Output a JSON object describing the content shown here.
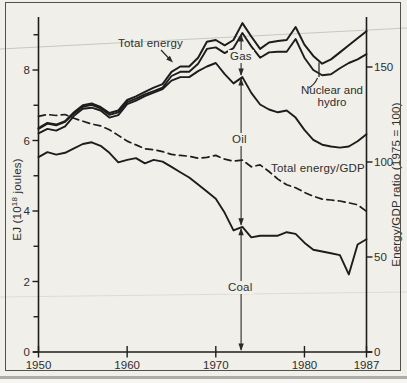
{
  "figure": {
    "paper_color": "#f1efe9",
    "frame_color": "#53514d",
    "line_color": "#1d1d1d",
    "artifact_line_color": "#c9c7c1"
  },
  "left_axis": {
    "title_pre": "EJ (10",
    "title_sup": "18",
    "title_post": " joules)",
    "major_tick_values": [
      0,
      2,
      4,
      6,
      8
    ],
    "major_tick_labels": [
      "0",
      "2",
      "4",
      "6",
      "8"
    ],
    "minor_tick_values": [
      1,
      3,
      5,
      7,
      9
    ]
  },
  "right_axis": {
    "title": "Energy/GDP ratio (1975 = 100)",
    "tick_values": [
      0,
      50,
      100,
      150
    ],
    "tick_labels": [
      "0",
      "50",
      "100",
      "150"
    ]
  },
  "x_axis": {
    "tick_values": [
      1950,
      1960,
      1970,
      1980,
      1987
    ],
    "tick_labels": [
      "1950",
      "1960",
      "1970",
      "1980",
      "1987"
    ]
  },
  "annotations": {
    "total_energy": "Total energy",
    "gas": "Gas",
    "oil": "Oil",
    "coal": "Coal",
    "nuclear_line1": "Nuclear and",
    "nuclear_line2": "hydro",
    "gdp": "Total energy/GDP",
    "marker_year": 1973
  },
  "chart_data": {
    "type": "line",
    "title": "",
    "xlabel": "",
    "ylabel_left": "EJ (10^18 joules)",
    "ylabel_right": "Energy/GDP ratio (1975 = 100)",
    "xlim": [
      1950,
      1987
    ],
    "ylim_left": [
      0,
      9.5
    ],
    "ylim_right": [
      0,
      160
    ],
    "grid": false,
    "legend_position": "inline-annotations",
    "x": [
      1950,
      1951,
      1952,
      1953,
      1954,
      1955,
      1956,
      1957,
      1958,
      1959,
      1960,
      1961,
      1962,
      1963,
      1964,
      1965,
      1966,
      1967,
      1968,
      1969,
      1970,
      1971,
      1972,
      1973,
      1974,
      1975,
      1976,
      1977,
      1978,
      1979,
      1980,
      1981,
      1982,
      1983,
      1984,
      1985,
      1986,
      1987
    ],
    "series": [
      {
        "id": "coal",
        "name": "Coal",
        "axis": "left",
        "style": "solid",
        "values": [
          5.53,
          5.67,
          5.6,
          5.65,
          5.78,
          5.9,
          5.95,
          5.85,
          5.65,
          5.38,
          5.45,
          5.5,
          5.35,
          5.45,
          5.4,
          5.25,
          5.1,
          4.95,
          4.75,
          4.55,
          4.35,
          3.95,
          3.45,
          3.55,
          3.25,
          3.3,
          3.3,
          3.3,
          3.4,
          3.35,
          3.1,
          2.9,
          2.85,
          2.8,
          2.75,
          2.2,
          3.05,
          3.2
        ]
      },
      {
        "id": "oil",
        "name": "Coal + Oil (top of Oil band)",
        "axis": "left",
        "style": "solid",
        "values": [
          6.2,
          6.33,
          6.28,
          6.4,
          6.7,
          6.9,
          6.93,
          6.85,
          6.65,
          6.72,
          7.03,
          7.13,
          7.26,
          7.36,
          7.46,
          7.7,
          7.8,
          7.8,
          7.97,
          8.1,
          8.2,
          7.88,
          7.62,
          7.8,
          7.35,
          7.02,
          6.88,
          6.8,
          6.85,
          6.65,
          6.3,
          6.02,
          5.88,
          5.83,
          5.8,
          5.83,
          5.98,
          6.18
        ]
      },
      {
        "id": "gas",
        "name": "Coal + Oil + Gas (top of Gas band)",
        "axis": "left",
        "style": "solid",
        "values": [
          6.33,
          6.48,
          6.43,
          6.53,
          6.77,
          6.96,
          7.01,
          6.91,
          6.73,
          6.8,
          7.09,
          7.19,
          7.31,
          7.4,
          7.5,
          7.83,
          7.95,
          7.95,
          8.18,
          8.6,
          8.64,
          8.48,
          8.62,
          9.05,
          8.67,
          8.35,
          8.5,
          8.52,
          8.52,
          8.88,
          8.35,
          8.0,
          7.85,
          7.88,
          8.05,
          8.2,
          8.3,
          8.45
        ]
      },
      {
        "id": "total",
        "name": "Total energy (incl. Nuclear and hydro)",
        "axis": "left",
        "style": "solid",
        "values": [
          6.35,
          6.5,
          6.45,
          6.55,
          6.8,
          7.0,
          7.05,
          6.95,
          6.78,
          6.85,
          7.15,
          7.25,
          7.38,
          7.5,
          7.6,
          7.95,
          8.1,
          8.1,
          8.35,
          8.8,
          8.85,
          8.7,
          8.85,
          9.33,
          8.95,
          8.6,
          8.78,
          8.82,
          8.85,
          9.22,
          8.72,
          8.4,
          8.18,
          8.3,
          8.5,
          8.7,
          8.9,
          9.1
        ]
      },
      {
        "id": "energy-gdp",
        "name": "Total energy/GDP",
        "axis": "right",
        "style": "dashed",
        "values": [
          124,
          125,
          124.5,
          125,
          123,
          121.5,
          120,
          119,
          117,
          114,
          111,
          109,
          107,
          106.5,
          105.5,
          104,
          103.5,
          103,
          102,
          102.5,
          103.5,
          101.5,
          100.5,
          101,
          97.5,
          98.5,
          95,
          91,
          88,
          86.5,
          84,
          82,
          80.5,
          80,
          79.5,
          78.5,
          77.5,
          74
        ]
      }
    ]
  }
}
